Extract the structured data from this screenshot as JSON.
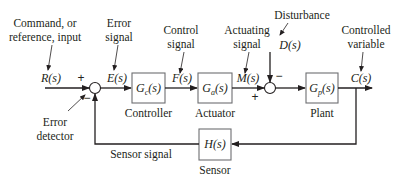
{
  "diagram": {
    "type": "feedback-control-block-diagram",
    "annotations": {
      "command_line1": "Command, or",
      "command_line2": "reference, input",
      "error_line1": "Error",
      "error_line2": "signal",
      "control_line1": "Control",
      "control_line2": "signal",
      "actuating_line1": "Actuating",
      "actuating_line2": "signal",
      "disturbance": "Disturbance",
      "controlled_line1": "Controlled",
      "controlled_line2": "variable",
      "detector_line1": "Error",
      "detector_line2": "detector",
      "sensor_signal": "Sensor signal"
    },
    "signals": {
      "R": "R(s)",
      "E": "E(s)",
      "F": "F(s)",
      "M": "M(s)",
      "D": "D(s)",
      "C": "C(s)"
    },
    "blocks": [
      {
        "id": "controller",
        "symbol": "G",
        "subscript": "c",
        "arg": "(s)",
        "label": "Controller"
      },
      {
        "id": "actuator",
        "symbol": "G",
        "subscript": "a",
        "arg": "(s)",
        "label": "Actuator"
      },
      {
        "id": "plant",
        "symbol": "G",
        "subscript": "p",
        "arg": "(s)",
        "label": "Plant"
      },
      {
        "id": "sensor",
        "symbol": "H",
        "subscript": "",
        "arg": "(s)",
        "label": "Sensor"
      }
    ],
    "junctions": [
      {
        "id": "error-detector",
        "signs": {
          "reference": "+",
          "feedback": "−"
        }
      },
      {
        "id": "disturbance-junction",
        "signs": {
          "actuating": "+",
          "disturbance": "−"
        }
      }
    ],
    "colors": {
      "ink": "#231f20",
      "box_border": "#6d6e71",
      "background": "#ffffff"
    }
  }
}
